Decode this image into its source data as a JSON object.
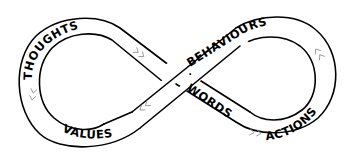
{
  "diagram": {
    "type": "infinity-loop",
    "labels": {
      "thoughts": "THOUGHTS",
      "values": "VALUES",
      "behaviours": "BEHAVIOURS",
      "words": "WORDS",
      "actions": "ACTIONS"
    },
    "arrow_glyphs": {
      "right": "> >",
      "left": "< <"
    },
    "colors": {
      "line": "#000000",
      "fill": "#ffffff",
      "arrow": "#9a9a9a"
    }
  }
}
